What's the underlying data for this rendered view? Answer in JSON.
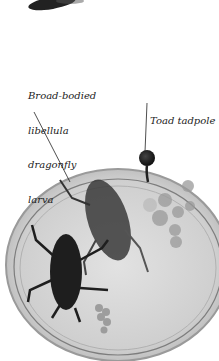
{
  "image": {
    "description": "Petri dish containing two dragonfly larvae, frog spawn and a toad tadpole, with annotations",
    "background_color": "#ffffff"
  },
  "labels": [
    {
      "id": "dragonfly",
      "lines": [
        "Broad-bodied",
        "libellula",
        "dragonfly",
        "larva"
      ]
    },
    {
      "id": "tadpole",
      "lines": [
        "Toad tadpole"
      ]
    }
  ],
  "colors": {
    "dish_fill": "#d6d6d6",
    "dish_rim": "#8a8a8a",
    "larva": "#1e1e1e",
    "leader_line": "#222222"
  }
}
